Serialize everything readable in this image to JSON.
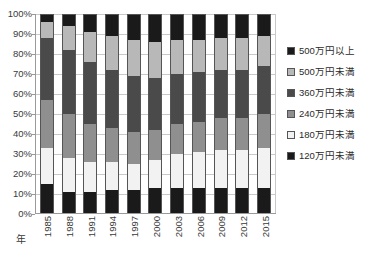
{
  "chart_data": {
    "type": "bar",
    "subtype": "stacked-100-percent",
    "title": "",
    "xlabel": "年",
    "ylabel": "",
    "ylim": [
      0,
      100
    ],
    "ytick_labels": [
      "100%",
      "90%",
      "80%",
      "70%",
      "60%",
      "50%",
      "40%",
      "30%",
      "20%",
      "10%",
      "0%"
    ],
    "ytick_values": [
      100,
      90,
      80,
      70,
      60,
      50,
      40,
      30,
      20,
      10,
      0
    ],
    "grid": true,
    "legend_position": "right",
    "categories": [
      "1985",
      "1988",
      "1991",
      "1994",
      "1997",
      "2000",
      "2003",
      "2006",
      "2009",
      "2012",
      "2015"
    ],
    "series": [
      {
        "name": "120万円未満",
        "color": "#1a1a1a",
        "values": [
          15,
          11,
          11,
          12,
          12,
          13,
          13,
          13,
          13,
          13,
          13
        ]
      },
      {
        "name": "180万円未満",
        "color": "#f2f2f2",
        "values": [
          18,
          17,
          15,
          14,
          13,
          14,
          17,
          18,
          19,
          19,
          20
        ]
      },
      {
        "name": "240万円未満",
        "color": "#8f8f8f",
        "values": [
          24,
          22,
          19,
          17,
          16,
          15,
          15,
          15,
          16,
          16,
          17
        ]
      },
      {
        "name": "360万円未満",
        "color": "#4a4a4a",
        "values": [
          31,
          32,
          31,
          29,
          28,
          26,
          25,
          25,
          24,
          24,
          24
        ]
      },
      {
        "name": "500万円未満",
        "color": "#b8b8b8",
        "values": [
          8,
          12,
          15,
          17,
          18,
          18,
          17,
          16,
          16,
          16,
          15
        ]
      },
      {
        "name": "500万円以上",
        "color": "#1a1a1a",
        "values": [
          4,
          6,
          9,
          11,
          13,
          14,
          13,
          13,
          12,
          12,
          11
        ]
      }
    ],
    "legend_order_top_to_bottom": [
      "500万円以上",
      "500万円未満",
      "360万円未満",
      "240万円未満",
      "180万円未満",
      "120万円未満"
    ]
  },
  "colors": {
    "axis": "#9a9a9a",
    "grid": "#c9c9c9",
    "text": "#3a3a3a",
    "segment_border": "#555555",
    "background": "#ffffff"
  }
}
